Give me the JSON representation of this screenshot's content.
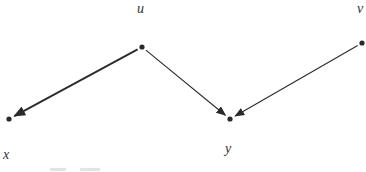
{
  "diagram": {
    "type": "directed-graph",
    "nodes": [
      {
        "id": "u",
        "label": "u",
        "x": 142,
        "y": 47,
        "label_x": 137,
        "label_y": 2
      },
      {
        "id": "v",
        "label": "v",
        "x": 362,
        "y": 43,
        "label_x": 357,
        "label_y": 2
      },
      {
        "id": "x",
        "label": "x",
        "x": 9,
        "y": 119,
        "label_x": 3,
        "label_y": 148
      },
      {
        "id": "y",
        "label": "y",
        "x": 230,
        "y": 119,
        "label_x": 225,
        "label_y": 142
      }
    ],
    "edges": [
      {
        "from": "u",
        "to": "x",
        "weight": "bold"
      },
      {
        "from": "u",
        "to": "y",
        "weight": "normal"
      },
      {
        "from": "v",
        "to": "y",
        "weight": "normal"
      }
    ],
    "colors": {
      "ink": "#2a2a2a",
      "label": "#333333"
    }
  }
}
